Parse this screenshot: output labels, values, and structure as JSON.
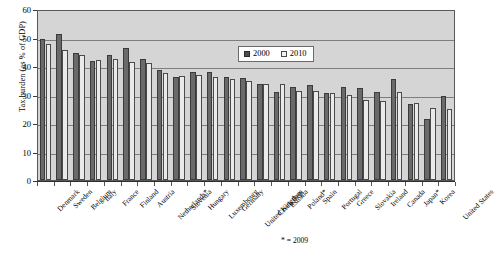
{
  "chart_data": {
    "type": "bar",
    "title": "",
    "xlabel": "",
    "ylabel": "Tax burden (as % of GDP)",
    "ylim": [
      0,
      60
    ],
    "yticks": [
      0,
      10,
      20,
      30,
      40,
      50,
      60
    ],
    "grid": true,
    "legend_position": "top-right-inside",
    "footnote": "* = 2009",
    "categories": [
      "Denmark",
      "Sweden",
      "Belgium",
      "Italy",
      "France",
      "Finland",
      "Austria",
      "Netherlands*",
      "Slovenia",
      "Hungary",
      "Luxembourg",
      "Germany",
      "United Kingdom",
      "Czech Rep.",
      "Estonia",
      "Poland*",
      "Spain",
      "Portugal",
      "Greece",
      "Slovakia",
      "Ireland",
      "Canada",
      "Japan*",
      "Korea",
      "United States"
    ],
    "series": [
      {
        "name": "2000",
        "color": "#6a6a6a",
        "values": [
          49.4,
          51.4,
          44.7,
          41.9,
          43.8,
          46.3,
          42.3,
          38.6,
          36.3,
          37.8,
          37.9,
          36.2,
          35.7,
          33.6,
          31.0,
          32.6,
          33.3,
          30.7,
          32.8,
          32.4,
          30.9,
          35.6,
          26.6,
          21.5,
          29.5
        ]
      },
      {
        "name": "2010",
        "color": "#eaeaea",
        "values": [
          47.8,
          45.5,
          43.8,
          42.1,
          42.5,
          41.5,
          41.2,
          37.6,
          36.4,
          36.7,
          36.1,
          35.3,
          34.9,
          33.8,
          33.8,
          31.1,
          31.2,
          30.4,
          30.0,
          28.1,
          27.6,
          31.0,
          26.9,
          25.1,
          24.8
        ]
      }
    ]
  }
}
